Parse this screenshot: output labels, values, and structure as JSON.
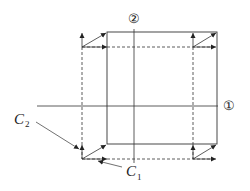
{
  "diagram": {
    "axes": [
      {
        "id": "axis-1",
        "label": "①",
        "orientation": "horizontal"
      },
      {
        "id": "axis-2",
        "label": "②",
        "orientation": "vertical"
      }
    ],
    "labels": {
      "c1": {
        "main": "C",
        "sub": "1"
      },
      "c2": {
        "main": "C",
        "sub": "2"
      }
    },
    "colors": {
      "stroke": "#333333",
      "background": "#ffffff"
    }
  }
}
